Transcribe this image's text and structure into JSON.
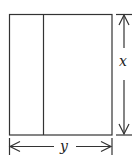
{
  "diagram": {
    "type": "rectangle-with-dimensions",
    "rectangle": {
      "x": 9,
      "y": 14,
      "width": 103,
      "height": 121
    },
    "divider_x": 43,
    "labels": {
      "height": "x",
      "width": "y"
    },
    "colors": {
      "stroke": "#333333",
      "background": "#ffffff"
    }
  }
}
